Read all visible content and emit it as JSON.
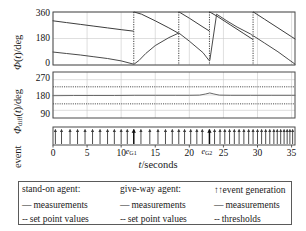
{
  "chart_data": {
    "type": "line",
    "title": "",
    "xlabel": "t/seconds",
    "xlim": [
      0,
      35.5
    ],
    "xticks": [
      0,
      5,
      10,
      15,
      20,
      25,
      30,
      35
    ],
    "xtick_labels": [
      "0",
      "5",
      "10",
      "15",
      "20",
      "25",
      "30",
      "35"
    ],
    "grid": true,
    "panels": [
      {
        "id": "phi-panel",
        "ylabel": "Φ(t)/deg",
        "ylim": [
          0,
          360
        ],
        "yticks": [
          0,
          180,
          360
        ],
        "ytick_labels": [
          "0",
          "180",
          "360"
        ],
        "series": [
          {
            "name": "stand-on agent measurements",
            "style": "solid",
            "color": "#3d3d3d",
            "points": [
              [
                0,
                300
              ],
              [
                2,
                288
              ],
              [
                4,
                276
              ],
              [
                6,
                264
              ],
              [
                8,
                252
              ],
              [
                10,
                240
              ],
              [
                11.8,
                230
              ],
              [
                11.9,
                360
              ],
              [
                13,
                345
              ],
              [
                15,
                300
              ],
              [
                17,
                252
              ],
              [
                18.4,
                216
              ],
              [
                18.5,
                360
              ],
              [
                20,
                318
              ],
              [
                22,
                258
              ],
              [
                22.9,
                232
              ],
              [
                23.0,
                360
              ],
              [
                24,
                333
              ],
              [
                26,
                273
              ],
              [
                28,
                213
              ],
              [
                29.3,
                174
              ],
              [
                29.4,
                360
              ],
              [
                31,
                312
              ],
              [
                33,
                252
              ],
              [
                35,
                192
              ],
              [
                35.5,
                177
              ]
            ]
          },
          {
            "name": "give-way agent measurements",
            "style": "solid",
            "color": "#4a4a4a",
            "points": [
              [
                0,
                88
              ],
              [
                2,
                78
              ],
              [
                4,
                68
              ],
              [
                6,
                56
              ],
              [
                8,
                44
              ],
              [
                10,
                28
              ],
              [
                11.8,
                6
              ],
              [
                11.9,
                6
              ],
              [
                12.6,
                30
              ],
              [
                13.6,
                78
              ],
              [
                15,
                132
              ],
              [
                17,
                186
              ],
              [
                18.4,
                216
              ],
              [
                18.5,
                216
              ],
              [
                20,
                162
              ],
              [
                22,
                84
              ],
              [
                22.9,
                30
              ],
              [
                23.0,
                30
              ],
              [
                24,
                345
              ],
              [
                25.5,
                300
              ],
              [
                27,
                258
              ],
              [
                29,
                210
              ],
              [
                29.3,
                198
              ],
              [
                29.4,
                198
              ],
              [
                31,
                150
              ],
              [
                33,
                90
              ],
              [
                34.6,
                36
              ],
              [
                35.5,
                6
              ]
            ]
          }
        ],
        "event_lines": [
          11.85,
          18.45,
          22.95,
          29.35
        ]
      },
      {
        "id": "phidiff-panel",
        "ylabel": "Φ_diff(t)/deg",
        "ylim": [
          45,
          315
        ],
        "yticks": [
          90,
          180,
          270
        ],
        "ytick_labels": [
          "90",
          "180",
          "270"
        ],
        "series": [
          {
            "name": "measurements",
            "style": "solid",
            "color": "#6a6a6a",
            "points": [
              [
                0,
                176
              ],
              [
                3,
                177
              ],
              [
                6,
                177
              ],
              [
                9,
                177
              ],
              [
                12,
                178
              ],
              [
                15,
                178
              ],
              [
                18,
                178
              ],
              [
                20,
                178
              ],
              [
                21.5,
                179
              ],
              [
                22.4,
                186
              ],
              [
                23.0,
                192
              ],
              [
                23.6,
                186
              ],
              [
                24.4,
                179
              ],
              [
                26,
                178
              ],
              [
                29,
                178
              ],
              [
                32,
                178
              ],
              [
                35,
                178
              ],
              [
                35.5,
                178
              ]
            ]
          },
          {
            "name": "upper threshold",
            "style": "dotted",
            "color": "#4d4d4d",
            "value": 228
          },
          {
            "name": "lower threshold",
            "style": "dotted",
            "color": "#4d4d4d",
            "value": 128
          }
        ]
      },
      {
        "id": "event-panel",
        "ylabel": "event",
        "events": [
          0.35,
          1.25,
          2.5,
          3.6,
          4.7,
          5.8,
          6.9,
          8.0,
          9.0,
          10.0,
          10.9,
          11.85,
          12.9,
          14.2,
          15.4,
          16.5,
          17.5,
          18.45,
          19.3,
          20.2,
          21.1,
          21.9,
          22.95,
          23.7,
          24.5,
          25.2,
          25.9,
          26.6,
          27.3,
          28.0,
          28.7,
          29.35,
          30.0,
          30.6,
          31.2,
          31.8,
          32.4,
          32.9,
          33.4,
          33.9,
          34.35,
          34.75,
          35.15
        ],
        "highlighted_events": [
          11.85,
          22.95
        ],
        "event_labels": [
          {
            "text": "e",
            "sub": "G1",
            "t": 11.85
          },
          {
            "text": "e",
            "sub": "G2",
            "t": 22.95
          }
        ]
      }
    ]
  },
  "legend": {
    "col1": {
      "header": "stand-on agent:",
      "rows": [
        {
          "glyph": "—",
          "label": "measurements"
        },
        {
          "glyph": "--",
          "label": "set point values"
        }
      ]
    },
    "col2": {
      "header": "give-way agent:",
      "rows": [
        {
          "glyph": "—",
          "label": "measurements"
        },
        {
          "glyph": "--",
          "label": "set point values"
        }
      ]
    },
    "col3": {
      "header": "event generation",
      "header_glyph": "↑↑",
      "rows": [
        {
          "glyph": "—",
          "label": "measurements"
        },
        {
          "glyph": "--",
          "label": "thresholds"
        }
      ]
    }
  },
  "axis_labels": {
    "left_combined": "event Φ_diff(t)/deg   Φ(t)/deg",
    "x_title": "t/seconds"
  },
  "colors": {
    "axis": "#4a4a4a",
    "grid": "#c9c9c9",
    "series": "#3d3d3d",
    "series_light": "#6a6a6a",
    "threshold": "#4d4d4d",
    "event": "#3a3a3a",
    "event_highlight": "#111111",
    "background": "#ffffff",
    "legend_border": "#5a5a5a"
  }
}
